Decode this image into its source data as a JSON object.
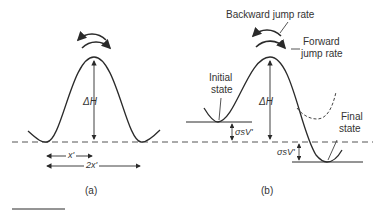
{
  "figure": {
    "panel_a": {
      "caption": "(a)",
      "barrier_label": "ΔH",
      "half_distance_label": "x'",
      "full_distance_label": "2x'"
    },
    "panel_b": {
      "caption": "(b)",
      "barrier_label": "ΔH",
      "backward_label": "Backward jump rate",
      "forward_label_line1": "Forward",
      "forward_label_line2": "jump rate",
      "initial_label_line1": "Initial",
      "initial_label_line2": "state",
      "final_label_line1": "Final",
      "final_label_line2": "state",
      "upper_shift_label": "σsV'",
      "lower_shift_label": "σsV'"
    }
  },
  "colors": {
    "stroke": "#2a2a2a",
    "text": "#333333",
    "background": "#ffffff"
  }
}
